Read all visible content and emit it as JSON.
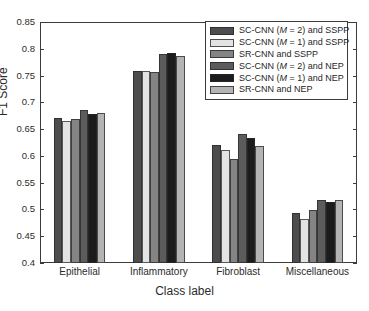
{
  "chart_data": {
    "type": "bar",
    "title": "",
    "xlabel": "Class label",
    "ylabel": "F1 Score",
    "ylim": [
      0.4,
      0.85
    ],
    "yticks": [
      "0.4",
      "0.45",
      "0.5",
      "0.55",
      "0.6",
      "0.65",
      "0.7",
      "0.75",
      "0.8",
      "0.85"
    ],
    "grid": false,
    "legend_position": "top-right",
    "categories": [
      "Epithelial",
      "Inflammatory",
      "Fibroblast",
      "Miscellaneous"
    ],
    "series": [
      {
        "name": "SC-CNN (M = 2) and SSPP",
        "color": "#4d4d4d",
        "values": [
          0.671,
          0.759,
          0.62,
          0.494
        ]
      },
      {
        "name": "SC-CNN (M = 1) and SSPP",
        "color": "#e3e3e3",
        "values": [
          0.665,
          0.759,
          0.611,
          0.483
        ]
      },
      {
        "name": "SR-CNN and SSPP",
        "color": "#848484",
        "values": [
          0.668,
          0.756,
          0.594,
          0.499
        ]
      },
      {
        "name": "SC-CNN (M = 2) and NEP",
        "color": "#5c5c5c",
        "values": [
          0.686,
          0.791,
          0.64,
          0.517
        ]
      },
      {
        "name": "SC-CNN (M = 1) and NEP",
        "color": "#1c1c1c",
        "values": [
          0.678,
          0.792,
          0.633,
          0.513
        ]
      },
      {
        "name": "SR-CNN and NEP",
        "color": "#b4b4b4",
        "values": [
          0.68,
          0.787,
          0.618,
          0.517
        ]
      }
    ]
  },
  "legend": {
    "entries": [
      {
        "prefix": "SC-CNN (",
        "italic": "M",
        "suffix": " = 2) and SSPP"
      },
      {
        "prefix": "SC-CNN (",
        "italic": "M",
        "suffix": " = 1) and SSPP"
      },
      {
        "prefix": "SR-CNN and SSPP",
        "italic": "",
        "suffix": ""
      },
      {
        "prefix": "SC-CNN (",
        "italic": "M",
        "suffix": " = 2) and NEP"
      },
      {
        "prefix": "SC-CNN (",
        "italic": "M",
        "suffix": " = 1) and NEP"
      },
      {
        "prefix": "SR-CNN and NEP",
        "italic": "",
        "suffix": ""
      }
    ]
  }
}
